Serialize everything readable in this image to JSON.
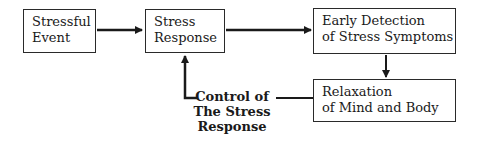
{
  "diagram": {
    "nodes": [
      {
        "id": "stressful-event",
        "lines": [
          "Stressful",
          "Event"
        ]
      },
      {
        "id": "stress-response",
        "lines": [
          "Stress",
          "Response"
        ]
      },
      {
        "id": "early-detection",
        "lines": [
          "Early Detection",
          "of Stress Symptoms"
        ]
      },
      {
        "id": "relaxation",
        "lines": [
          "Relaxation",
          "of Mind and Body"
        ]
      }
    ],
    "feedback_label": {
      "lines": [
        "Control of",
        "The Stress",
        "Response"
      ]
    },
    "edges": [
      {
        "from": "stressful-event",
        "to": "stress-response"
      },
      {
        "from": "stress-response",
        "to": "early-detection"
      },
      {
        "from": "early-detection",
        "to": "relaxation"
      },
      {
        "from": "relaxation",
        "to": "stress-response",
        "label": "Control of The Stress Response"
      }
    ],
    "colors": {
      "stroke": "#2a2a2a",
      "background": "#ffffff"
    }
  }
}
